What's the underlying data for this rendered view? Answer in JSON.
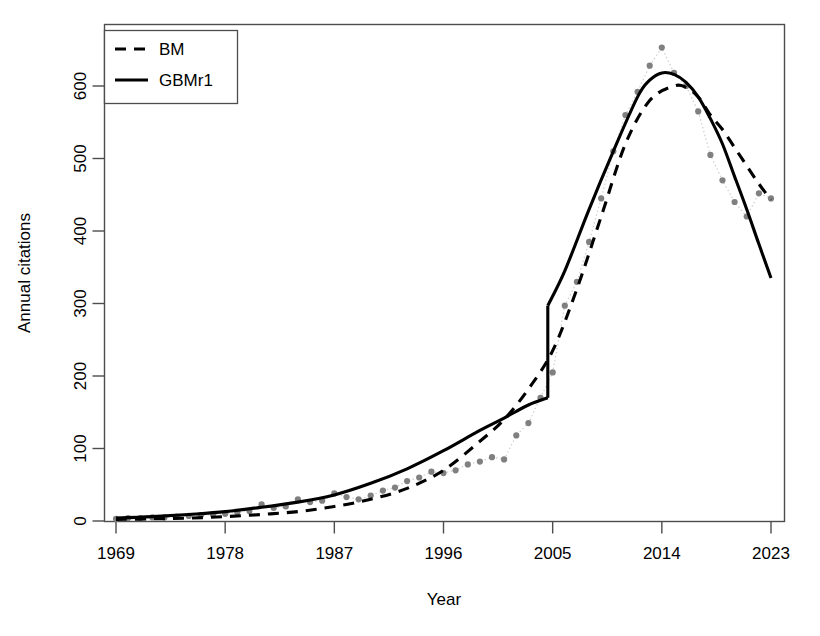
{
  "chart_data": {
    "type": "line",
    "title": "",
    "xlabel": "Year",
    "ylabel": "Annual citations",
    "xlim": [
      1969,
      2023
    ],
    "ylim": [
      0,
      660
    ],
    "xticks": [
      1969,
      1978,
      1987,
      1996,
      2005,
      2014,
      2023
    ],
    "yticks": [
      0,
      100,
      200,
      300,
      400,
      500,
      600
    ],
    "grid": false,
    "legend_position": "top-left",
    "legend": [
      {
        "label": "BM",
        "style": "dashed",
        "color": "#000000"
      },
      {
        "label": "GBMr1",
        "style": "solid",
        "color": "#000000"
      }
    ],
    "observed": {
      "name": "Observed annual citations",
      "marker": "circle",
      "color": "#808080",
      "connector": "dotted",
      "x": [
        1969,
        1970,
        1971,
        1972,
        1973,
        1974,
        1975,
        1976,
        1977,
        1978,
        1979,
        1980,
        1981,
        1982,
        1983,
        1984,
        1985,
        1986,
        1987,
        1988,
        1989,
        1990,
        1991,
        1992,
        1993,
        1994,
        1995,
        1996,
        1997,
        1998,
        1999,
        2000,
        2001,
        2002,
        2003,
        2004,
        2005,
        2006,
        2007,
        2008,
        2009,
        2010,
        2011,
        2012,
        2013,
        2014,
        2015,
        2016,
        2017,
        2018,
        2019,
        2020,
        2021,
        2022,
        2023
      ],
      "y": [
        3,
        4,
        4,
        5,
        5,
        6,
        7,
        8,
        9,
        10,
        12,
        14,
        23,
        18,
        20,
        30,
        26,
        28,
        38,
        33,
        30,
        35,
        42,
        46,
        55,
        60,
        68,
        66,
        70,
        78,
        82,
        88,
        85,
        118,
        135,
        170,
        205,
        297,
        330,
        385,
        445,
        510,
        560,
        592,
        628,
        653,
        618,
        600,
        565,
        505,
        470,
        440,
        420,
        452,
        445
      ]
    },
    "series": [
      {
        "name": "BM",
        "style": "dashed",
        "color": "#000000",
        "x": [
          1969,
          1972,
          1975,
          1978,
          1981,
          1984,
          1987,
          1990,
          1993,
          1996,
          1999,
          2001,
          2003,
          2005,
          2007,
          2009,
          2011,
          2013,
          2015,
          2016,
          2017,
          2018,
          2019,
          2020,
          2021,
          2022,
          2023
        ],
        "y": [
          2,
          3,
          4,
          6,
          9,
          13,
          20,
          30,
          45,
          70,
          110,
          140,
          182,
          235,
          320,
          420,
          520,
          580,
          600,
          598,
          585,
          560,
          540,
          515,
          490,
          465,
          443
        ]
      },
      {
        "name": "GBMr1",
        "style": "solid",
        "color": "#000000",
        "segment1_x": [
          1969,
          1972,
          1975,
          1978,
          1981,
          1984,
          1987,
          1990,
          1993,
          1996,
          1999,
          2001,
          2003,
          2004.6
        ],
        "segment1_y": [
          4,
          6,
          9,
          13,
          19,
          26,
          36,
          52,
          72,
          97,
          125,
          142,
          160,
          170
        ],
        "jump_year": 2004.6,
        "jump_from": 170,
        "jump_to": 297,
        "segment2_x": [
          2004.6,
          2006,
          2008,
          2010,
          2012,
          2013,
          2014,
          2015,
          2016,
          2017,
          2018,
          2019,
          2020,
          2021,
          2022,
          2023
        ],
        "segment2_y": [
          297,
          345,
          430,
          510,
          585,
          608,
          618,
          616,
          605,
          585,
          555,
          520,
          475,
          430,
          382,
          335
        ]
      }
    ]
  }
}
